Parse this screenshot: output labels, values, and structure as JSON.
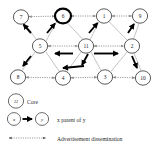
{
  "figure": {
    "node_radius": 7.2,
    "colors": {
      "node_stroke": "#4a4a4a",
      "core_stroke": "#000000",
      "ad_edge": "#8a8a8a",
      "tree_edge": "#b5b5b5",
      "parent_arrow": "#000000",
      "background": "#ffffff",
      "text": "#1a1a1a"
    }
  },
  "graph": {
    "nodes": [
      {
        "id": "7",
        "label": "7",
        "x": 21,
        "y": 17,
        "core": false
      },
      {
        "id": "6",
        "label": "6",
        "x": 63,
        "y": 16,
        "core": true
      },
      {
        "id": "1",
        "label": "1",
        "x": 104,
        "y": 16,
        "core": false
      },
      {
        "id": "9",
        "label": "9",
        "x": 140,
        "y": 16,
        "core": false
      },
      {
        "id": "5",
        "label": "5",
        "x": 40,
        "y": 46,
        "core": false
      },
      {
        "id": "11",
        "label": "11",
        "x": 86,
        "y": 46,
        "core": false
      },
      {
        "id": "2",
        "label": "2",
        "x": 132,
        "y": 46,
        "core": false
      },
      {
        "id": "8",
        "label": "8",
        "x": 18,
        "y": 77,
        "core": false
      },
      {
        "id": "4",
        "label": "4",
        "x": 63,
        "y": 78,
        "core": false
      },
      {
        "id": "3",
        "label": "3",
        "x": 105,
        "y": 77,
        "core": false
      },
      {
        "id": "10",
        "label": "10",
        "x": 143,
        "y": 78,
        "core": false
      }
    ],
    "ad_edges": [
      {
        "from": "7",
        "to": "6"
      },
      {
        "from": "6",
        "to": "1"
      },
      {
        "from": "1",
        "to": "9"
      },
      {
        "from": "5",
        "to": "11"
      },
      {
        "from": "11",
        "to": "2"
      },
      {
        "from": "8",
        "to": "4"
      },
      {
        "from": "4",
        "to": "3"
      },
      {
        "from": "3",
        "to": "10"
      },
      {
        "from": "7",
        "to": "5"
      },
      {
        "from": "6",
        "to": "5"
      },
      {
        "from": "6",
        "to": "11"
      },
      {
        "from": "1",
        "to": "11"
      },
      {
        "from": "1",
        "to": "2"
      },
      {
        "from": "9",
        "to": "2"
      },
      {
        "from": "5",
        "to": "8"
      },
      {
        "from": "5",
        "to": "4"
      },
      {
        "from": "11",
        "to": "4"
      },
      {
        "from": "11",
        "to": "3"
      },
      {
        "from": "2",
        "to": "3"
      },
      {
        "from": "2",
        "to": "10"
      }
    ],
    "parent_arrows": [
      {
        "from": "5",
        "to": "7",
        "note": "5 parent of 7"
      },
      {
        "from": "5",
        "to": "6",
        "note": "5 parent of 6"
      },
      {
        "from": "11",
        "to": "1",
        "note": "11 parent of 1"
      },
      {
        "from": "2",
        "to": "9",
        "note": "2 parent of 9"
      },
      {
        "from": "5",
        "to": "8",
        "note": "5 parent of 8"
      },
      {
        "from": "11",
        "to": "5",
        "note": "11 to 5"
      },
      {
        "from": "11",
        "to": "2",
        "note": "11 to 2"
      },
      {
        "from": "11",
        "to": "4",
        "note": "11 to 4"
      },
      {
        "from": "11",
        "to": "3",
        "note": "11 to 3"
      },
      {
        "from": "2",
        "to": "10",
        "note": "2 parent of 10"
      }
    ]
  },
  "legend": {
    "items": [
      {
        "key": "core",
        "symbol_label": "11",
        "text": "Core"
      },
      {
        "key": "parent",
        "symbol_from": "x",
        "symbol_to": "y",
        "text": "x parent of y"
      },
      {
        "key": "advertisement",
        "text": "Advertisement dissemination"
      }
    ]
  }
}
